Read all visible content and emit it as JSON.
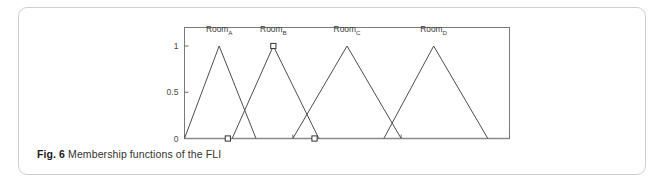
{
  "figure": {
    "caption_label": "Fig. 6",
    "caption_text": "Membership functions of the FLI"
  },
  "chart_data": {
    "type": "line",
    "title": "",
    "xlabel": "",
    "ylabel": "",
    "xlim": [
      0,
      15
    ],
    "ylim": [
      0,
      1.2
    ],
    "xticks": [
      0,
      5,
      10,
      15
    ],
    "xticklabels": [
      "0",
      "5",
      "10",
      "15"
    ],
    "yticks": [
      0,
      0.5,
      1
    ],
    "yticklabels": [
      "0",
      "0.5",
      "1"
    ],
    "grid": false,
    "legend": "none",
    "annotations": [
      {
        "text": "Room",
        "sub": "A",
        "x": 1.6,
        "y": 1.15
      },
      {
        "text": "Room",
        "sub": "B",
        "x": 4.1,
        "y": 1.15
      },
      {
        "text": "Room",
        "sub": "C",
        "x": 7.5,
        "y": 1.15
      },
      {
        "text": "Room",
        "sub": "D",
        "x": 11.5,
        "y": 1.15
      }
    ],
    "series": [
      {
        "name": "RoomA",
        "x": [
          0,
          1.6,
          3.3
        ],
        "values": [
          0,
          1,
          0
        ]
      },
      {
        "name": "RoomB",
        "x": [
          2.2,
          4.1,
          6.2
        ],
        "values": [
          0,
          1,
          0
        ]
      },
      {
        "name": "RoomC",
        "x": [
          5.0,
          7.5,
          10.0
        ],
        "values": [
          0,
          1,
          0
        ]
      },
      {
        "name": "RoomD",
        "x": [
          9.2,
          11.5,
          14.0
        ],
        "values": [
          0,
          1,
          0
        ]
      }
    ],
    "markers": [
      {
        "x": 2.0,
        "y": 0
      },
      {
        "x": 4.1,
        "y": 1
      },
      {
        "x": 6.0,
        "y": 0
      }
    ],
    "colors": {
      "line": "#4d4d4d",
      "axis": "#6e6e6e",
      "marker_fill": "#ffffff",
      "marker_stroke": "#333333",
      "baseline": "#8a8a8a"
    }
  }
}
